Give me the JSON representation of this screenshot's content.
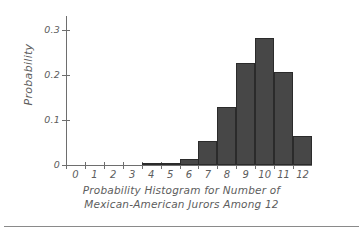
{
  "chart_data": {
    "type": "bar",
    "title": "Probability Histogram for Number of Mexican-American Jurors Among 12",
    "title_lines": [
      "Probability Histogram for Number of",
      "Mexican-American Jurors Among 12"
    ],
    "xlabel": "",
    "ylabel": "Probability",
    "categories": [
      "0",
      "1",
      "2",
      "3",
      "4",
      "5",
      "6",
      "7",
      "8",
      "9",
      "10",
      "11",
      "12"
    ],
    "values": [
      0.0,
      0.0,
      0.0,
      0.0,
      0.002,
      0.005,
      0.014,
      0.054,
      0.129,
      0.226,
      0.281,
      0.205,
      0.065
    ],
    "ylim": [
      0,
      0.33
    ],
    "xlim": [
      -0.5,
      12.5
    ],
    "y_ticks": [
      0,
      0.1,
      0.2,
      0.3
    ],
    "y_tick_labels": [
      "0",
      "0.1",
      "0.2",
      "0.3"
    ],
    "x_tick_labels": [
      "0",
      "1",
      "2",
      "3",
      "4",
      "5",
      "6",
      "7",
      "8",
      "9",
      "10",
      "11",
      "12"
    ],
    "grid": false,
    "legend": null,
    "bar_fill_color": "#474747",
    "bar_edge_color": "#2b2b2b",
    "axis_color": "#6e6e6e",
    "text_color": "#5d5d5d",
    "background_color": "#ffffff"
  }
}
